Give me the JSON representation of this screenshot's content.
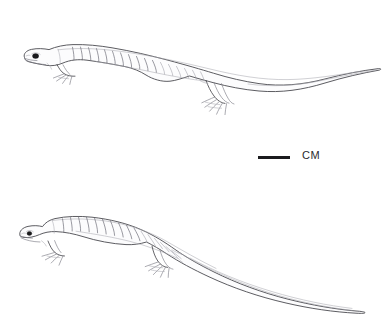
{
  "figure": {
    "background_color": "#ffffff",
    "ink_color": "#4a4a4f",
    "width": 388,
    "height": 327
  },
  "scale": {
    "label": "CM",
    "bar_color": "#1b1b1e",
    "bar_left": 258,
    "bar_top": 156,
    "bar_width": 32,
    "bar_height": 3,
    "label_left": 302,
    "label_top": 149
  },
  "specimens": [
    {
      "id": "specimen-upper",
      "name": "upper-salamander",
      "posture": "straight body, long tapering tail sweeping upward to the right",
      "eye_color": "#1a1a1c",
      "costal_groove_count": 17
    },
    {
      "id": "specimen-lower",
      "name": "lower-salamander",
      "posture": "arched back, tail curving down and to the right",
      "eye_color": "#1a1a1c",
      "costal_groove_count": 16
    }
  ]
}
